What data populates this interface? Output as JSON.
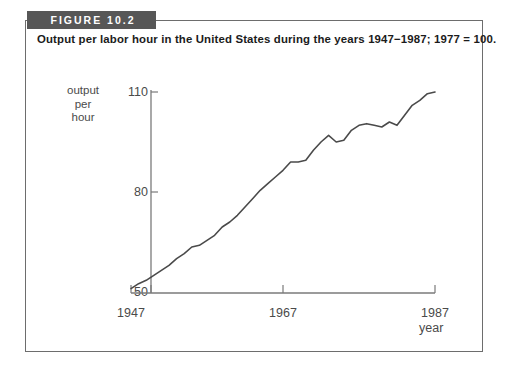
{
  "figure": {
    "badge": "FIGURE 10.2",
    "caption": "Output per labor hour in the United States during the years 1947−1987; 1977 = 100."
  },
  "axes": {
    "ylabel_line1": "output",
    "ylabel_line2": "per",
    "ylabel_line3": "hour",
    "xlabel": "year",
    "ytick_110": "110",
    "ytick_80": "80",
    "ytick_50": "50",
    "xtick_1947": "1947",
    "xtick_1967": "1967",
    "xtick_1987": "1987"
  },
  "colors": {
    "banner": "#575757",
    "border": "#6d6d6d",
    "axis": "#7a7a7a",
    "line": "#4a4a4a",
    "text": "#4a4a4a"
  },
  "chart_data": {
    "type": "line",
    "title": "Output per labor hour in the United States during the years 1947−1987; 1977 = 100.",
    "xlabel": "year",
    "ylabel": "output per hour",
    "xlim": [
      1947,
      1987
    ],
    "ylim": [
      50,
      110
    ],
    "xticks": [
      1947,
      1967,
      1987
    ],
    "yticks": [
      50,
      80,
      110
    ],
    "grid": false,
    "legend": null,
    "series": [
      {
        "name": "output per hour",
        "x": [
          1947,
          1948,
          1949,
          1950,
          1951,
          1952,
          1953,
          1954,
          1955,
          1956,
          1957,
          1958,
          1959,
          1960,
          1961,
          1962,
          1963,
          1964,
          1965,
          1966,
          1967,
          1968,
          1969,
          1970,
          1971,
          1972,
          1973,
          1974,
          1975,
          1976,
          1977,
          1978,
          1979,
          1980,
          1981,
          1982,
          1983,
          1984,
          1985,
          1986,
          1987
        ],
        "y": [
          51.0,
          52.5,
          53.5,
          55.0,
          56.5,
          58.0,
          60.0,
          61.5,
          63.5,
          64.0,
          65.5,
          67.0,
          69.5,
          71.0,
          73.0,
          75.5,
          78.0,
          80.5,
          82.5,
          84.5,
          86.5,
          89.0,
          89.0,
          89.5,
          92.5,
          95.0,
          97.0,
          95.0,
          95.5,
          98.5,
          100.0,
          100.5,
          100.0,
          99.5,
          101.0,
          100.0,
          103.0,
          106.0,
          107.5,
          109.5,
          110.0
        ]
      }
    ]
  }
}
